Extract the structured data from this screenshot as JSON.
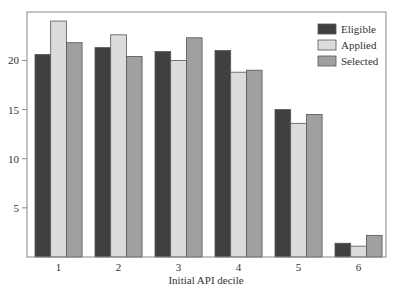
{
  "chart_data": {
    "type": "bar",
    "title": "",
    "xlabel": "Initial API decile",
    "ylabel": "",
    "categories": [
      "1",
      "2",
      "3",
      "4",
      "5",
      "6"
    ],
    "series": [
      {
        "name": "Eligible",
        "color": "#404040",
        "values": [
          20.6,
          21.3,
          20.9,
          21.0,
          15.0,
          1.4
        ]
      },
      {
        "name": "Applied",
        "color": "#dcdcdc",
        "values": [
          24.0,
          22.6,
          20.0,
          18.8,
          13.6,
          1.1
        ]
      },
      {
        "name": "Selected",
        "color": "#a0a0a0",
        "values": [
          21.8,
          20.4,
          22.3,
          19.0,
          14.5,
          2.2
        ]
      }
    ],
    "yticks": [
      5,
      10,
      15,
      20
    ],
    "ylim": [
      0,
      24.7
    ],
    "grid": false,
    "legend_position": "upper right"
  }
}
